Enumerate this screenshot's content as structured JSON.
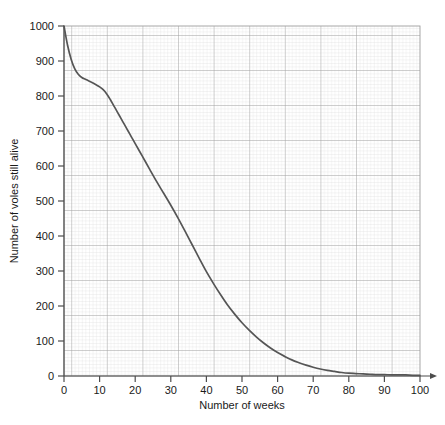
{
  "chart_data": {
    "type": "line",
    "title": "",
    "xlabel": "Number of weeks",
    "ylabel": "Number of voles still alive",
    "xlim": [
      0,
      100
    ],
    "ylim": [
      0,
      1000
    ],
    "grid": true,
    "grid_minor": true,
    "legend": "none",
    "xticks": [
      0,
      10,
      20,
      30,
      40,
      50,
      60,
      70,
      80,
      90,
      100
    ],
    "yticks": [
      0,
      100,
      200,
      300,
      400,
      500,
      600,
      700,
      800,
      900,
      1000
    ],
    "xtick_labels": [
      "0",
      "10",
      "20",
      "30",
      "40",
      "50",
      "60",
      "70",
      "80",
      "90",
      "100"
    ],
    "ytick_labels": [
      "0",
      "100",
      "200",
      "300",
      "400",
      "500",
      "600",
      "700",
      "800",
      "900",
      "1000"
    ],
    "series": [
      {
        "name": "voles still alive",
        "color": "#555555",
        "x": [
          0,
          1,
          2,
          3,
          4,
          5,
          6,
          7,
          8,
          9,
          10,
          11,
          12,
          13,
          14,
          15,
          16,
          17,
          18,
          19,
          20,
          22,
          24,
          26,
          28,
          30,
          32,
          34,
          36,
          38,
          40,
          42,
          44,
          46,
          48,
          50,
          52,
          54,
          56,
          58,
          60,
          62,
          64,
          66,
          68,
          70,
          72,
          74,
          76,
          78,
          80,
          82,
          84,
          86,
          88,
          90,
          92,
          94,
          96,
          98,
          100
        ],
        "values": [
          1000,
          945,
          905,
          878,
          862,
          853,
          848,
          843,
          838,
          832,
          826,
          818,
          806,
          790,
          772,
          754,
          736,
          718,
          700,
          682,
          664,
          628,
          592,
          556,
          522,
          488,
          452,
          414,
          375,
          336,
          298,
          264,
          232,
          202,
          176,
          152,
          131,
          112,
          95,
          80,
          67,
          56,
          46,
          38,
          31,
          25,
          20,
          16,
          13,
          10,
          8,
          7,
          6,
          5,
          4,
          4,
          3,
          3,
          3,
          2,
          2
        ]
      }
    ],
    "axis_arrow_x": true,
    "colors": {
      "curve": "#555555",
      "grid_minor": "#d8d8d8",
      "grid_major": "#9a9a9a",
      "axis": "#4d4d4d",
      "text": "#1a1a1a",
      "background": "#ffffff"
    }
  }
}
